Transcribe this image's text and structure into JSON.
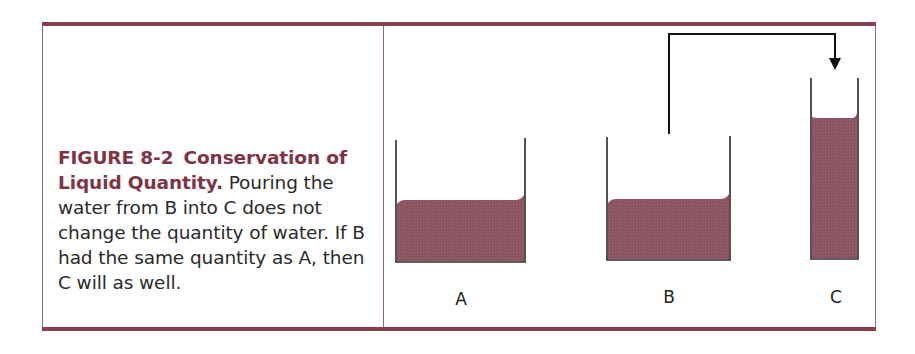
{
  "figure": {
    "number": "FIGURE 8-2",
    "title": "Conservation of Liquid Quantity.",
    "description": "Pouring the water from B into C does not change the quantity of water. If B had the same quantity as A, then C will as well."
  },
  "colors": {
    "rule": "#8a3f4f",
    "heading": "#7e3445",
    "liquid": "#8e5563",
    "outline": "#2a2a2a"
  },
  "containers": [
    {
      "id": "A",
      "label": "A",
      "shape": "wide",
      "liquid": "same quantity"
    },
    {
      "id": "B",
      "label": "B",
      "shape": "wide",
      "liquid": "same quantity"
    },
    {
      "id": "C",
      "label": "C",
      "shape": "tall narrow",
      "liquid": "poured from B"
    }
  ],
  "arrow": {
    "from": "B",
    "to": "C",
    "meaning": "pour"
  }
}
